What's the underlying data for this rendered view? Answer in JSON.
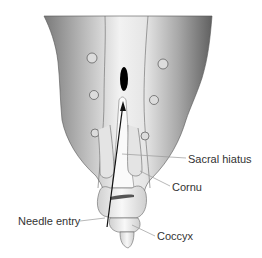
{
  "figure": {
    "labels": {
      "sacral_hiatus": "Sacral hiatus",
      "cornu": "Cornu",
      "needle_entry": "Needle entry",
      "coccyx": "Coccyx"
    },
    "colors": {
      "bone_dark": "#6a6a6a",
      "bone_light": "#f2f2f2",
      "outline": "#555555",
      "leader_line": "#999999",
      "needle": "#111111",
      "hiatus": "#000000",
      "label_text": "#333333"
    }
  }
}
